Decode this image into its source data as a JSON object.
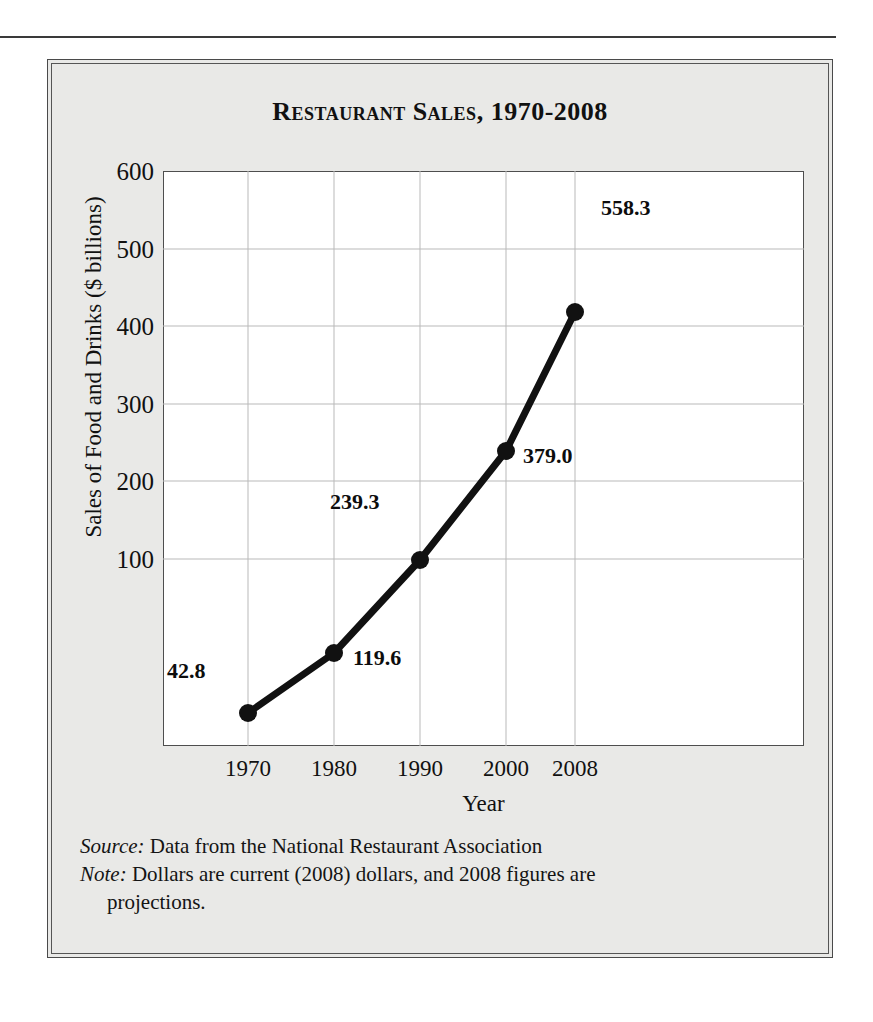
{
  "figure": {
    "title": "Restaurant Sales, 1970-2008",
    "source_label": "Source:",
    "source_text": " Data from the National Restaurant Association",
    "note_label": "Note:",
    "note_text": " Dollars are current (2008) dollars, and 2008 figures are",
    "note_text_cont": "projections.",
    "panel_bg": "#e9e9e7",
    "plot_bg": "#ffffff",
    "ink": "#111111",
    "grid_color": "#b9b9b9"
  },
  "chart_data": {
    "type": "line",
    "title": "Restaurant Sales, 1970-2008",
    "xlabel": "Year",
    "ylabel": "Sales of Food and Drinks ($ billions)",
    "categories": [
      "1970",
      "1980",
      "1990",
      "2000",
      "2008"
    ],
    "x": [
      1970,
      1980,
      1990,
      2000,
      2008
    ],
    "values": [
      42.8,
      119.6,
      239.3,
      379.0,
      558.3
    ],
    "point_labels": [
      "42.8",
      "119.6",
      "239.3",
      "379.0",
      "558.3"
    ],
    "y_ticks": [
      100,
      200,
      300,
      400,
      500,
      600
    ],
    "y_tick_labels": [
      "100",
      "200",
      "300",
      "400",
      "500",
      "600"
    ],
    "x_tick_labels": [
      "1970",
      "1980",
      "1990",
      "2000",
      "2008"
    ],
    "ylim": [
      -41,
      600
    ],
    "xlim": [
      1960.2,
      2010.6
    ],
    "grid": true,
    "legend": "none",
    "series": [
      {
        "name": "Sales of Food and Drinks",
        "values": [
          42.8,
          119.6,
          239.3,
          379.0,
          558.3
        ],
        "line_color": "#111111",
        "marker": "circle",
        "marker_color": "#111111"
      }
    ]
  },
  "geometry": {
    "y_tick_y": [
      558,
      480,
      403,
      325,
      248,
      170
    ],
    "x_tick_x": [
      247,
      333,
      419,
      505,
      574
    ],
    "point_px": [
      {
        "x": 247,
        "y": 712
      },
      {
        "x": 333,
        "y": 652
      },
      {
        "x": 419,
        "y": 559
      },
      {
        "x": 505,
        "y": 450
      },
      {
        "x": 574,
        "y": 311
      }
    ],
    "label_px": [
      {
        "x": 166,
        "y": 659,
        "align": "left"
      },
      {
        "x": 352,
        "y": 646,
        "align": "left"
      },
      {
        "x": 329,
        "y": 490,
        "align": "left"
      },
      {
        "x": 522,
        "y": 444,
        "align": "left"
      },
      {
        "x": 600,
        "y": 196,
        "align": "left"
      }
    ]
  }
}
